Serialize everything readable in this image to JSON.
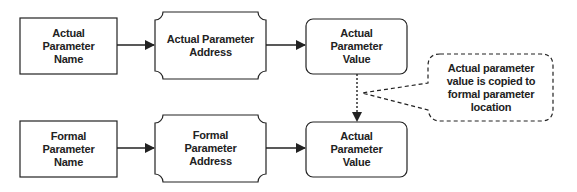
{
  "diagram": {
    "top_row": {
      "name": "Actual Parameter Name",
      "address": "Actual Parameter Address",
      "value": "Actual Parameter Value"
    },
    "bottom_row": {
      "name": "Formal Parameter Name",
      "address": "Formal Parameter Address",
      "value": "Actual Parameter Value"
    },
    "callout": "Actual parameter value is copied to formal parameter location",
    "colors": {
      "stroke": "#222222",
      "background": "#ffffff"
    }
  }
}
